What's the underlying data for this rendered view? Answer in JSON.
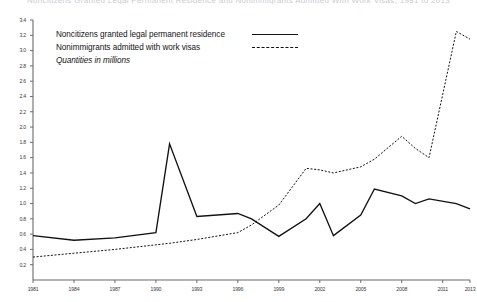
{
  "chart_data": {
    "type": "line",
    "title": "Noncitizens Granted Legal Permanent Residence and Nonimmigrants Admitted With Work Visas, 1981 to 2013",
    "xlabel": "",
    "ylabel": "",
    "note": "Quantities in millions",
    "legend_position": "upper-left",
    "grid": false,
    "xlim": [
      1981,
      2013
    ],
    "ylim": [
      0,
      3.4
    ],
    "ytick_labels": [
      "3.4",
      "3.2",
      "3.0",
      "2.8",
      "2.6",
      "2.4",
      "2.2",
      "2.0",
      "1.8",
      "1.6",
      "1.4",
      "1.2",
      "1.0",
      "0.8",
      "0.6",
      "0.4",
      "0.2"
    ],
    "ytick_values": [
      3.4,
      3.2,
      3.0,
      2.8,
      2.6,
      2.4,
      2.2,
      2.0,
      1.8,
      1.6,
      1.4,
      1.2,
      1.0,
      0.8,
      0.6,
      0.4,
      0.2
    ],
    "xtick_labels": [
      "1981",
      "1984",
      "1987",
      "1990",
      "1993",
      "1996",
      "1999",
      "2002",
      "2005",
      "2008",
      "2011",
      "2013"
    ],
    "xtick_values": [
      1981,
      1984,
      1987,
      1990,
      1993,
      1996,
      1999,
      2002,
      2005,
      2008,
      2011,
      2013
    ],
    "x": [
      1981,
      1984,
      1987,
      1990,
      1991,
      1993,
      1996,
      1997,
      1999,
      2001,
      2002,
      2003,
      2005,
      2006,
      2008,
      2009,
      2010,
      2012,
      2013
    ],
    "series": [
      {
        "name": "Noncitizens granted legal permanent residence",
        "style": "solid",
        "color": "#111111",
        "values": [
          0.58,
          0.52,
          0.55,
          0.62,
          1.78,
          0.83,
          0.87,
          0.8,
          0.57,
          0.8,
          1.0,
          0.58,
          0.85,
          1.19,
          1.1,
          1.0,
          1.06,
          1.0,
          0.93
        ]
      },
      {
        "name": "Nonimmigrants admitted with work visas",
        "style": "dashed",
        "color": "#111111",
        "values": [
          0.3,
          0.35,
          0.4,
          0.46,
          0.48,
          0.53,
          0.62,
          0.72,
          0.98,
          1.46,
          1.44,
          1.4,
          1.48,
          1.58,
          1.88,
          1.72,
          1.6,
          3.25,
          3.15
        ]
      }
    ]
  },
  "legend": {
    "items": [
      {
        "label": "Noncitizens granted legal permanent residence",
        "key": "solid-line-key"
      },
      {
        "label": "Nonimmigrants admitted with work visas",
        "key": "dashed-line-key"
      }
    ],
    "note": "Quantities in millions"
  },
  "colors": {
    "axis": "#6b6b6b",
    "line": "#111111",
    "tick_text": "#3a3a3a",
    "background": "#ffffff"
  }
}
